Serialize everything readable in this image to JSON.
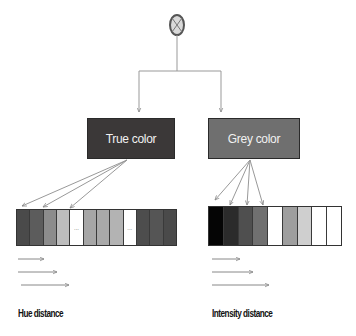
{
  "diagram": {
    "root_node": {
      "icon": "circle-x-icon"
    },
    "nodes": [
      {
        "id": "true-color",
        "label": "True color",
        "color": "#3b3838"
      },
      {
        "id": "grey-color",
        "label": "Grey color",
        "color": "#6f6f6f"
      }
    ],
    "strips": {
      "hue": {
        "cells": [
          {
            "color": "#4a4a4a",
            "text": ""
          },
          {
            "color": "#5c5c5c",
            "text": ""
          },
          {
            "color": "#8c8c8c",
            "text": ""
          },
          {
            "color": "#bdbdbd",
            "text": ""
          },
          {
            "color": "#ffffff",
            "text": "..."
          },
          {
            "color": "#a6a6a6",
            "text": ""
          },
          {
            "color": "#a9a9a9",
            "text": ""
          },
          {
            "color": "#b3b3b3",
            "text": ""
          },
          {
            "color": "#ffffff",
            "text": "..."
          },
          {
            "color": "#4d4d4d",
            "text": ""
          },
          {
            "color": "#555555",
            "text": ""
          },
          {
            "color": "#4a4a4a",
            "text": ""
          }
        ],
        "label": "Hue distance"
      },
      "intensity": {
        "cells": [
          {
            "color": "#050505",
            "text": ""
          },
          {
            "color": "#2b2b2b",
            "text": ""
          },
          {
            "color": "#4f4f4f",
            "text": ""
          },
          {
            "color": "#707070",
            "text": ""
          },
          {
            "color": "#ffffff",
            "text": ""
          },
          {
            "color": "#9e9e9e",
            "text": ""
          },
          {
            "color": "#cfcfcf",
            "text": ""
          },
          {
            "color": "#ffffff",
            "text": ""
          },
          {
            "color": "#ffffff",
            "text": ""
          }
        ],
        "label": "Intensity distance"
      }
    }
  }
}
